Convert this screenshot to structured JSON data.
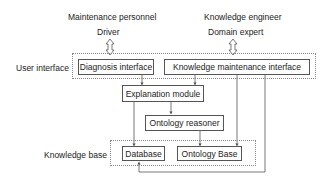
{
  "actors": {
    "left": {
      "role": "Maintenance personnel",
      "name": "Driver"
    },
    "right": {
      "role": "Knowledge engineer",
      "name": "Domain expert"
    }
  },
  "layers": {
    "user_interface": {
      "label": "User interface",
      "components": [
        "Diagnosis interface",
        "Knowledge maintenance interface"
      ]
    },
    "knowledge_base": {
      "label": "Knowledge base",
      "components": [
        "Database",
        "Ontology Base"
      ]
    }
  },
  "modules": {
    "explanation": "Explanation module",
    "reasoner": "Ontology reasoner"
  },
  "colors": {
    "line": "#555555",
    "group_border": "#888888"
  },
  "connections": [
    {
      "from": "Driver",
      "to": "Diagnosis interface",
      "type": "double-arrow"
    },
    {
      "from": "Domain expert",
      "to": "Knowledge maintenance interface",
      "type": "double-arrow"
    },
    {
      "from": "Diagnosis interface",
      "to": "Explanation module",
      "type": "arrow"
    },
    {
      "from": "Knowledge maintenance interface",
      "to": "Explanation module",
      "type": "arrow"
    },
    {
      "from": "Explanation module",
      "to": "Ontology reasoner",
      "type": "arrow"
    },
    {
      "from": "Explanation module",
      "to": "Database",
      "type": "arrow"
    },
    {
      "from": "Ontology reasoner",
      "to": "Ontology Base",
      "type": "arrow"
    },
    {
      "from": "Knowledge maintenance interface",
      "to": "Ontology Base",
      "type": "arrow"
    },
    {
      "from": "Knowledge maintenance interface",
      "to": "Database",
      "type": "arrow"
    }
  ]
}
